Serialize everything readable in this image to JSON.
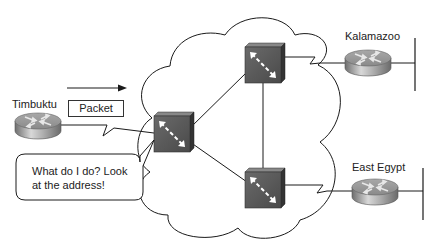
{
  "diagram": {
    "type": "network-topology",
    "nodes": {
      "timbuktu": {
        "label": "Timbuktu",
        "kind": "router"
      },
      "kalamazoo": {
        "label": "Kalamazoo",
        "kind": "router"
      },
      "east_egypt": {
        "label": "East Egypt",
        "kind": "router"
      },
      "switch_left": {
        "label": "",
        "kind": "wan-switch"
      },
      "switch_top": {
        "label": "",
        "kind": "wan-switch"
      },
      "switch_bottom": {
        "label": "",
        "kind": "wan-switch"
      }
    },
    "edges": [
      {
        "from": "timbuktu",
        "to": "switch_left",
        "style": "serial"
      },
      {
        "from": "switch_left",
        "to": "switch_top",
        "style": "solid"
      },
      {
        "from": "switch_left",
        "to": "switch_bottom",
        "style": "solid"
      },
      {
        "from": "switch_top",
        "to": "switch_bottom",
        "style": "solid"
      },
      {
        "from": "switch_top",
        "to": "kalamazoo",
        "style": "serial"
      },
      {
        "from": "switch_bottom",
        "to": "east_egypt",
        "style": "serial"
      }
    ],
    "packet": {
      "label": "Packet",
      "direction": "right"
    },
    "callout": {
      "text": "What do I do? Look at the address!",
      "line1": "What do I do? Look",
      "line2": "at the address!",
      "points_to": "switch_left"
    },
    "colors": {
      "switch_fill": "#5a5a5a",
      "switch_top": "#7a7a7a",
      "line": "#1a1a1a",
      "router_body": "#9a9a9a"
    }
  }
}
